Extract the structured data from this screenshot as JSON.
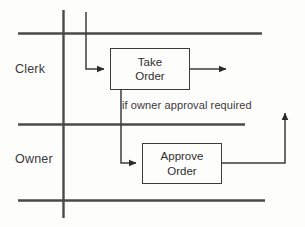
{
  "diagram": {
    "type": "swimlane-activity-diagram",
    "background_color": "#fdfdfc",
    "line_color": "#4a4a4a",
    "text_color": "#3a3a3a",
    "lanes": [
      {
        "id": "clerk",
        "label": "Clerk"
      },
      {
        "id": "owner",
        "label": "Owner"
      }
    ],
    "activities": [
      {
        "id": "take-order",
        "lane": "clerk",
        "line1": "Take",
        "line2": "Order"
      },
      {
        "id": "approve-order",
        "lane": "owner",
        "line1": "Approve",
        "line2": "Order"
      }
    ],
    "guards": [
      {
        "id": "owner-approval",
        "text": "if owner approval required"
      }
    ],
    "flows": [
      {
        "id": "start-to-take-order",
        "from": "start",
        "to": "take-order",
        "arrow": "right"
      },
      {
        "id": "take-order-to-end",
        "from": "take-order",
        "to": "end",
        "arrow": "right"
      },
      {
        "id": "take-order-to-approve-order",
        "from": "take-order",
        "to": "approve-order",
        "arrow": "right"
      },
      {
        "id": "approve-order-return",
        "from": "approve-order",
        "to": "merge",
        "arrow": "up"
      }
    ]
  }
}
